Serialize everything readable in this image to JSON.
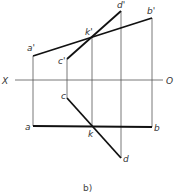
{
  "diagram": {
    "caption": "b)",
    "axis": {
      "left_label": "X",
      "right_label": "O"
    },
    "points": {
      "a_prime": {
        "label": "a'",
        "x": 33,
        "y": 56
      },
      "b_prime": {
        "label": "b'",
        "x": 152,
        "y": 18
      },
      "c_prime": {
        "label": "c'",
        "x": 67,
        "y": 59
      },
      "d_prime": {
        "label": "d'",
        "x": 121,
        "y": 11
      },
      "k_prime": {
        "label": "k'",
        "x": 92,
        "y": 37
      },
      "a": {
        "label": "a",
        "x": 33,
        "y": 126
      },
      "b": {
        "label": "b",
        "x": 152,
        "y": 127
      },
      "c": {
        "label": "c",
        "x": 67,
        "y": 98
      },
      "d": {
        "label": "d",
        "x": 121,
        "y": 158
      },
      "k": {
        "label": "k",
        "x": 92,
        "y": 127
      }
    }
  }
}
